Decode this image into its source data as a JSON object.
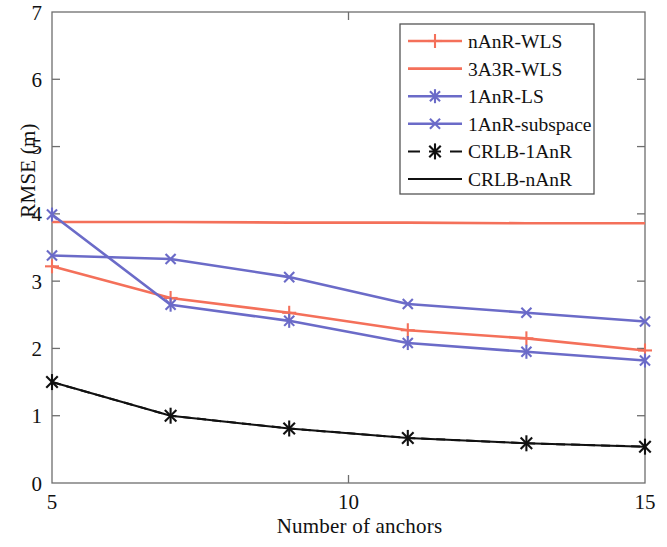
{
  "chart_data": {
    "type": "line",
    "title": "",
    "xlabel": "Number of anchors",
    "ylabel": "RMSE (m)",
    "x": [
      5,
      7,
      9,
      11,
      13,
      15
    ],
    "xlim": [
      5,
      15
    ],
    "ylim": [
      0,
      7
    ],
    "xticks": [
      5,
      10,
      15
    ],
    "xtick_labels": [
      "5",
      "10",
      "15"
    ],
    "yticks": [
      0,
      1,
      2,
      3,
      4,
      5,
      6,
      7
    ],
    "ytick_labels": [
      "0",
      "1",
      "2",
      "3",
      "4",
      "5",
      "6",
      "7"
    ],
    "grid": false,
    "legend_position": "top-right",
    "series": [
      {
        "name": "nAnR-WLS",
        "color": "#f4705a",
        "marker": "plus",
        "linestyle": "solid",
        "values": [
          3.22,
          2.75,
          2.53,
          2.27,
          2.15,
          1.97
        ]
      },
      {
        "name": "3A3R-WLS",
        "color": "#f4705a",
        "marker": "none",
        "linestyle": "solid",
        "values": [
          3.88,
          3.88,
          3.87,
          3.87,
          3.86,
          3.86
        ]
      },
      {
        "name": "1AnR-LS",
        "color": "#6b6bc8",
        "marker": "asterisk",
        "linestyle": "solid",
        "values": [
          3.99,
          2.65,
          2.41,
          2.08,
          1.95,
          1.82
        ]
      },
      {
        "name": "1AnR-subspace",
        "color": "#6b6bc8",
        "marker": "cross",
        "linestyle": "solid",
        "values": [
          3.38,
          3.33,
          3.06,
          2.66,
          2.53,
          2.4
        ]
      },
      {
        "name": "CRLB-1AnR",
        "color": "#111111",
        "marker": "asterisk",
        "linestyle": "dashed",
        "values": [
          1.5,
          1.0,
          0.81,
          0.67,
          0.59,
          0.54
        ]
      },
      {
        "name": "CRLB-nAnR",
        "color": "#111111",
        "marker": "none",
        "linestyle": "solid",
        "values": [
          1.5,
          1.0,
          0.81,
          0.67,
          0.59,
          0.54
        ]
      }
    ]
  },
  "axes": {
    "x_label": "Number of anchors",
    "y_label": "RMSE (m)"
  },
  "legend": {
    "entries": [
      {
        "label": "nAnR-WLS"
      },
      {
        "label": "3A3R-WLS"
      },
      {
        "label": "1AnR-LS"
      },
      {
        "label": "1AnR-subspace"
      },
      {
        "label": "CRLB-1AnR"
      },
      {
        "label": "CRLB-nAnR"
      }
    ]
  }
}
